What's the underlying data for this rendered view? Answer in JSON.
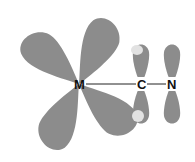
{
  "diagram": {
    "atoms": [
      {
        "label": "M",
        "x": 79,
        "y": 84
      },
      {
        "label": "C",
        "x": 141,
        "y": 84
      },
      {
        "label": "N",
        "x": 172,
        "y": 84
      }
    ],
    "colors": {
      "lobe": "#8c8c8c",
      "overlap": "#e2e2e2",
      "bond": "#222222",
      "background": "#ffffff"
    }
  }
}
